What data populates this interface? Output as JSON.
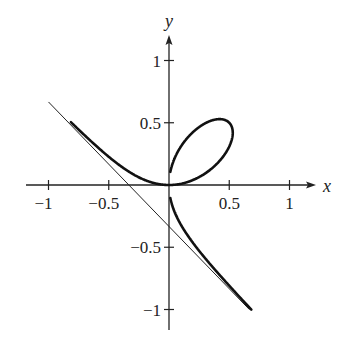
{
  "chart_data": {
    "type": "line",
    "title": "",
    "xlabel": "x",
    "ylabel": "y",
    "xlim": [
      -1.2,
      1.25
    ],
    "ylim": [
      -1.15,
      1.2
    ],
    "grid": false,
    "legend": null,
    "x_ticks": [
      -1,
      -0.5,
      0.5,
      1
    ],
    "x_tick_labels": [
      "−1",
      "−0.5",
      "0.5",
      "1"
    ],
    "y_ticks": [
      1,
      0.5,
      -0.5,
      -1
    ],
    "y_tick_labels": [
      "1",
      "0.5",
      "−0.5",
      "−1"
    ],
    "series": [
      {
        "name": "curve x^3 + y^3 = xy (folium)",
        "style": "thick",
        "parametric": "x = t/(1+t^3), y = t^2/(1+t^3)",
        "points_sample": [
          [
            -1,
            0.71
          ],
          [
            -0.5,
            0.26
          ],
          [
            0,
            0
          ],
          [
            0.3,
            0.12
          ],
          [
            0.53,
            0.42
          ],
          [
            0.42,
            0.53
          ],
          [
            0.2,
            0.37
          ],
          [
            0,
            0.1
          ],
          [
            0,
            -0.1
          ],
          [
            0.3,
            -0.7
          ],
          [
            0.68,
            -1.0
          ]
        ]
      },
      {
        "name": "asymptote x + y = -1/3",
        "style": "thin",
        "points": [
          [
            -1,
            0.667
          ],
          [
            0.667,
            -1
          ]
        ]
      }
    ]
  },
  "labels": {
    "x_axis": "x",
    "y_axis": "y"
  }
}
